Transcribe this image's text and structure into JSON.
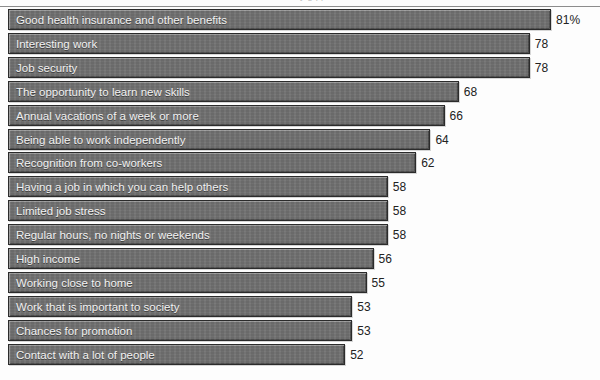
{
  "figure": {
    "clipped_title_fragment": "y  g      pp",
    "value_suffix_first": "%"
  },
  "chart_data": {
    "type": "bar",
    "orientation": "horizontal",
    "title": "",
    "xlabel": "",
    "ylabel": "",
    "grid": false,
    "legend": "none",
    "xlim": [
      48,
      83
    ],
    "value_unit": "percent",
    "categories": [
      "Good health insurance and other benefits",
      "Interesting work",
      "Job security",
      "The opportunity to learn new skills",
      "Annual vacations of a week or more",
      "Being able to work independently",
      "Recognition from co-workers",
      "Having a job in which you can help others",
      "Limited job stress",
      "Regular hours, no nights or weekends",
      "High income",
      "Working close to home",
      "Work that is important to society",
      "Chances for promotion",
      "Contact with a lot of people"
    ],
    "values": [
      81,
      78,
      78,
      68,
      66,
      64,
      62,
      58,
      58,
      58,
      56,
      55,
      53,
      53,
      52
    ],
    "value_labels": [
      "81%",
      "78",
      "78",
      "68",
      "66",
      "64",
      "62",
      "58",
      "58",
      "58",
      "56",
      "55",
      "53",
      "53",
      "52"
    ],
    "colors": {
      "bar_fill": "#6f6f6f",
      "bar_border": "#2b2b2b",
      "bar_text": "#f2f2f2",
      "value_text": "#222222",
      "background": "#ffffff"
    }
  }
}
